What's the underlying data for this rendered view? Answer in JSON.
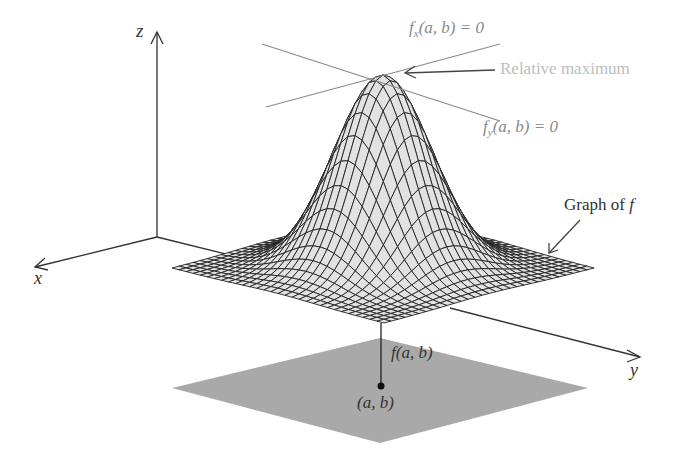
{
  "diagram": {
    "axes": {
      "x_label": "x",
      "y_label": "y",
      "z_label": "z"
    },
    "tangent_labels": {
      "fx": {
        "func": "f",
        "sub": "x",
        "args": "(a, b) = 0"
      },
      "fy": {
        "func": "f",
        "sub": "y",
        "args": "(a, b) = 0"
      }
    },
    "annotations": {
      "relative_maximum": "Relative maximum",
      "graph_of_f": "Graph of ",
      "graph_of_f_var": "f",
      "f_ab": "f(a, b)",
      "point_ab": "(a, b)"
    },
    "colors": {
      "axis": "#333333",
      "mesh_line": "#222222",
      "mesh_fill": "#e2e2e2",
      "tangent_line": "#8a8a8a",
      "plane_fill": "#a9a9a9",
      "relative_max_text": "#bdbdbd"
    }
  }
}
